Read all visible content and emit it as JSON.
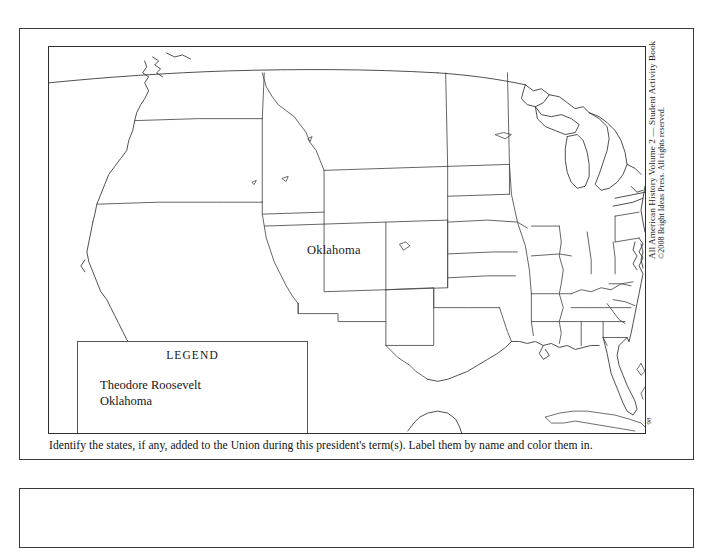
{
  "worksheet": {
    "map_title": "",
    "state_labels": [
      {
        "name": "Oklahoma"
      }
    ],
    "legend": {
      "title": "LEGEND",
      "entries": [
        "Theodore Roosevelt",
        "Oklahoma"
      ]
    },
    "instruction": "Identify the states, if any, added to the Union during this president's term(s). Label them by name and color them in.",
    "credit": {
      "title_line": "All American History Volume 2 — Student Activity Book",
      "copyright_line": "©2008 Bright Ideas Press. All rights reserved."
    },
    "page_number": "98"
  },
  "colors": {
    "page_border": "#3a3a3a",
    "map_stroke": "#4a4a4a",
    "text": "#1a1a1a",
    "background": "#ffffff"
  }
}
